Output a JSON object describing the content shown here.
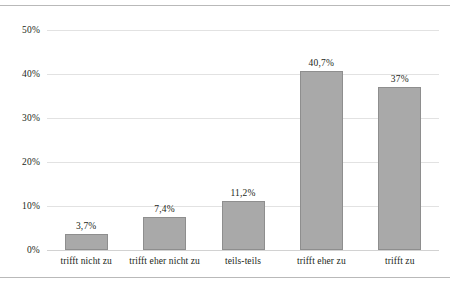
{
  "chart_data": {
    "type": "bar",
    "title": "",
    "subtitle": "",
    "xlabel": "",
    "ylabel": "",
    "categories": [
      "trifft nicht zu",
      "trifft eher nicht zu",
      "teils-teils",
      "trifft eher zu",
      "trifft zu"
    ],
    "values": [
      3.7,
      7.4,
      11.2,
      40.7,
      37.0
    ],
    "data_labels": [
      "3,7%",
      "7,4%",
      "11,2%",
      "40,7%",
      "37%"
    ],
    "ylim": [
      0,
      50
    ],
    "y_ticks": [
      0,
      10,
      20,
      30,
      40,
      50
    ],
    "y_tick_labels": [
      "0%",
      "10%",
      "20%",
      "30%",
      "40%",
      "50%"
    ],
    "grid": true,
    "legend": false,
    "legend_position": "none",
    "bar_color": "#a9a9a9",
    "bar_border_color": "#8e8e8e",
    "gridline_color": "#e2e2e2",
    "frame_color": "#b9b9b9",
    "text_color": "#231f20"
  }
}
